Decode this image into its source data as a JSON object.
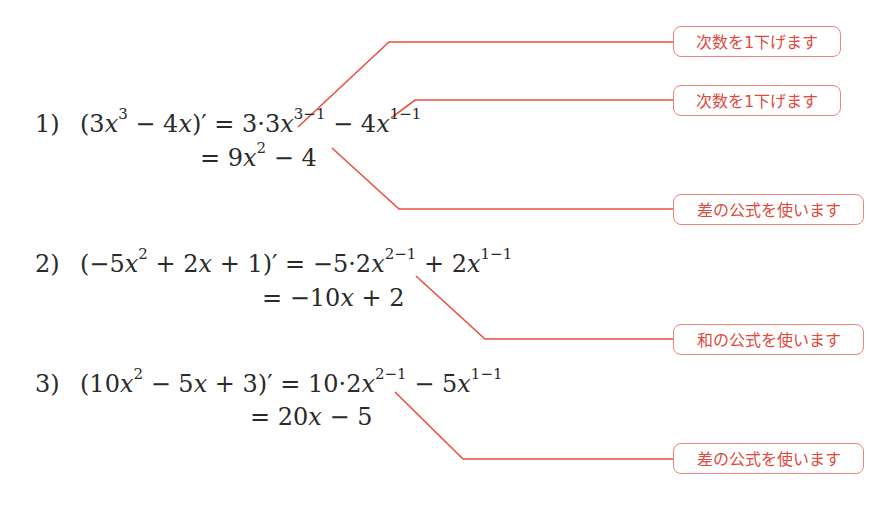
{
  "accent_color": "#e8503f",
  "problems": [
    {
      "number": "1)",
      "line1": {
        "lhs_open": "(3",
        "lhs_x1": "x",
        "lhs_exp1": "3",
        "lhs_mid": " − 4",
        "lhs_x2": "x",
        "lhs_close": ")′ = 3·3",
        "rhs_x1": "x",
        "rhs_exp1": "3−1",
        "rhs_op": " − 4",
        "rhs_x2": "x",
        "rhs_exp2": "1−1"
      },
      "line2": {
        "prefix": "= 9",
        "x": "x",
        "exp": "2",
        "suffix": " − 4"
      }
    },
    {
      "number": "2)",
      "line1": {
        "lhs_open": "(−5",
        "lhs_x1": "x",
        "lhs_exp1": "2",
        "lhs_mid": " + 2",
        "lhs_x2": "x",
        "lhs_close": " + 1)′ = −5·2",
        "rhs_x1": "x",
        "rhs_exp1": "2−1",
        "rhs_op": " + 2",
        "rhs_x2": "x",
        "rhs_exp2": "1−1"
      },
      "line2": {
        "prefix": "= −10",
        "x": "x",
        "exp": "",
        "suffix": " + 2"
      }
    },
    {
      "number": "3)",
      "line1": {
        "lhs_open": "(10",
        "lhs_x1": "x",
        "lhs_exp1": "2",
        "lhs_mid": " − 5",
        "lhs_x2": "x",
        "lhs_close": " + 3)′ = 10·2",
        "rhs_x1": "x",
        "rhs_exp1": "2−1",
        "rhs_op": " − 5",
        "rhs_x2": "x",
        "rhs_exp2": "1−1"
      },
      "line2": {
        "prefix": "= 20",
        "x": "x",
        "exp": "",
        "suffix": " − 5"
      }
    }
  ],
  "callouts": [
    {
      "text": "次数を1下げます"
    },
    {
      "text": "次数を1下げます"
    },
    {
      "text": "差の公式を使います"
    },
    {
      "text": "和の公式を使います"
    },
    {
      "text": "差の公式を使います"
    }
  ]
}
